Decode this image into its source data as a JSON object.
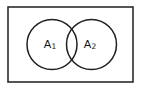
{
  "figure": {
    "kind": "venn-diagram",
    "background_color": "#ffffff",
    "line_color": "#1f1f1f",
    "rect_border_color": "#2b2b2b"
  },
  "universe": {
    "name": "universe-rectangle",
    "x": 8,
    "y": 7,
    "width": 125,
    "height": 75,
    "stroke_width": 1.6
  },
  "sets": [
    {
      "id": "A1",
      "label_base": "A",
      "label_sub": "1",
      "label_full": "A₁",
      "center_x": 52,
      "center_y": 44.5,
      "radius": 25,
      "label_x": 50,
      "label_y": 45
    },
    {
      "id": "A2",
      "label_base": "A",
      "label_sub": "2",
      "label_full": "A₂",
      "center_x": 91.5,
      "center_y": 44.5,
      "radius": 25,
      "label_x": 90,
      "label_y": 45
    }
  ],
  "intersection": {
    "name": "overlap-lens",
    "left_edge_x": 66.5,
    "right_edge_x": 77,
    "top_y": 22,
    "bottom_y": 67
  }
}
